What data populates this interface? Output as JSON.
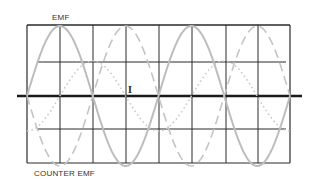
{
  "labels": {
    "emf": "EMF",
    "counter_emf": "COUNTER EMF",
    "current": "I"
  },
  "colors": {
    "grid": "#2a2a2a",
    "axis": "#1a1a1a",
    "emf_curve": "#bdbdbd",
    "counter_emf_curve": "#c4c4c4",
    "current_curve": "#c8c8c8"
  },
  "diagram": {
    "frame": {
      "left": 27,
      "top": 25,
      "right": 290,
      "bottom": 163
    },
    "axis_y": 96,
    "axis_x_range": [
      17,
      302
    ],
    "vertical_gridlines_x": [
      60,
      93,
      126,
      159,
      192,
      226,
      258
    ],
    "horizontal_gridlines_y": [
      62,
      129
    ],
    "period_px": 131.5,
    "amplitude_px": 70,
    "curves": [
      {
        "name": "EMF",
        "style": "solid",
        "phase_deg": 0
      },
      {
        "name": "Counter EMF",
        "style": "dashed",
        "phase_deg": 180
      },
      {
        "name": "Current I",
        "style": "dotted",
        "phase_deg": -90,
        "amplitude_ratio": 0.5
      }
    ]
  }
}
